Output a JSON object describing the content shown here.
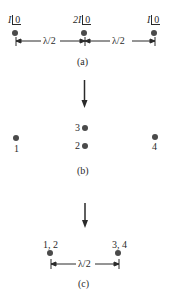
{
  "panel_a": {
    "caption": "(a)",
    "sources": [
      {
        "magnitude": "I",
        "angle": "0"
      },
      {
        "magnitude": "2I",
        "angle": "0"
      },
      {
        "magnitude": "I",
        "angle": "0"
      }
    ],
    "spacings": [
      "λ/2",
      "λ/2"
    ]
  },
  "panel_b": {
    "caption": "(b)",
    "elements": [
      {
        "label": "1"
      },
      {
        "label": "3"
      },
      {
        "label": "2"
      },
      {
        "label": "4"
      }
    ]
  },
  "panel_c": {
    "caption": "(c)",
    "elements": [
      {
        "label": "1, 2"
      },
      {
        "label": "3, 4"
      }
    ],
    "spacing": "λ/2"
  },
  "colors": {
    "ink": "#2a2a2a",
    "dot": "#4a4a4a",
    "background": "#ffffff"
  }
}
